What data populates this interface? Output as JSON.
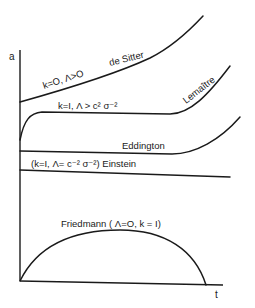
{
  "diagram": {
    "type": "cosmological scale factor vs time",
    "axes": {
      "y_label": "a",
      "x_label": "t"
    },
    "curves": [
      {
        "id": "de-sitter",
        "name": "de Sitter",
        "condition": "k=O, Λ>O"
      },
      {
        "id": "lemaitre",
        "name": "Lemaître",
        "condition": "k=I, Λ > c² σ⁻²"
      },
      {
        "id": "eddington",
        "name": "Eddington"
      },
      {
        "id": "einstein",
        "name": "Einstein",
        "condition": "(k=I, Λ= c⁻² σ⁻²)"
      },
      {
        "id": "friedmann",
        "name": "Friedmann",
        "condition": "( Λ=O, k = I)"
      }
    ],
    "labels": {
      "de_sitter_condition": "k=O, Λ>O",
      "de_sitter_name": "de Sitter",
      "lemaitre_name": "Lemaître",
      "lemaitre_condition": "k=I, Λ > c² σ⁻²",
      "eddington_name": "Eddington",
      "einstein_label": "(k=I, Λ= c⁻² σ⁻²) Einstein",
      "friedmann_label": "Friedmann ( Λ=O, k = I)"
    },
    "colors": {
      "ink": "#1a1a1a",
      "background": "#ffffff"
    }
  }
}
